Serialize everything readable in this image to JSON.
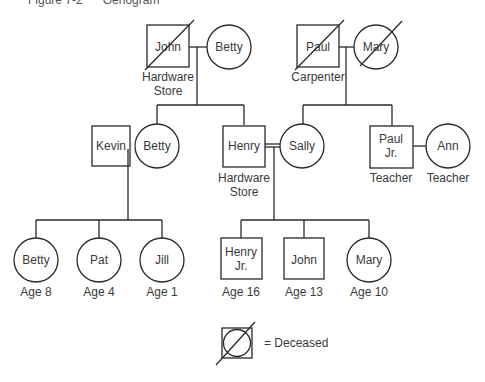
{
  "figure": {
    "caption": "Figure 7-2      Genogram"
  },
  "generation1": {
    "left_couple": {
      "husband": {
        "name": "John",
        "role_line1": "Hardware",
        "role_line2": "Store",
        "deceased": true
      },
      "wife": {
        "name": "Betty",
        "deceased": false
      }
    },
    "right_couple": {
      "husband": {
        "name": "Paul",
        "role_line1": "Carpenter",
        "deceased": true
      },
      "wife": {
        "name": "Mary",
        "deceased": true
      }
    }
  },
  "generation2": {
    "kevin": {
      "name": "Kevin"
    },
    "betty": {
      "name": "Betty"
    },
    "henry": {
      "name": "Henry",
      "role_line1": "Hardware",
      "role_line2": "Store"
    },
    "sally": {
      "name": "Sally"
    },
    "paul_jr": {
      "name_line1": "Paul",
      "name_line2": "Jr.",
      "role": "Teacher"
    },
    "ann": {
      "name": "Ann",
      "role": "Teacher"
    }
  },
  "generation3": {
    "left_children": [
      {
        "name": "Betty",
        "age": "Age 8",
        "sex": "female"
      },
      {
        "name": "Pat",
        "age": "Age 4",
        "sex": "female"
      },
      {
        "name": "Jill",
        "age": "Age 1",
        "sex": "female"
      }
    ],
    "right_children": [
      {
        "name_line1": "Henry",
        "name_line2": "Jr.",
        "age": "Age 16",
        "sex": "male"
      },
      {
        "name": "John",
        "age": "Age 13",
        "sex": "male"
      },
      {
        "name": "Mary",
        "age": "Age 10",
        "sex": "female"
      }
    ]
  },
  "legend": {
    "symbol": "deceased-symbol",
    "label": "= Deceased"
  },
  "colors": {
    "line": "#2a2a2a",
    "text": "#3a3a3a"
  }
}
